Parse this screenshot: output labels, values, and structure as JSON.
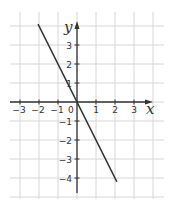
{
  "chart_data": {
    "type": "line",
    "title": "",
    "xlabel": "x",
    "ylabel": "y",
    "origin_label": "0",
    "xlim": [
      -3.5,
      4
    ],
    "ylim": [
      -5,
      4.2
    ],
    "grid": true,
    "x_ticks": [
      -3,
      -2,
      -1,
      1,
      2,
      3
    ],
    "y_ticks": [
      3,
      2,
      1,
      -1,
      -2,
      -3,
      -4
    ],
    "x_tick_labels": [
      "−3",
      "−2",
      "−1",
      "1",
      "2",
      "3"
    ],
    "y_tick_labels": [
      "3",
      "2",
      "1",
      "−1",
      "−2",
      "−3",
      "−4"
    ],
    "series": [
      {
        "name": "y = -2x",
        "x": [
          -2.05,
          2.1
        ],
        "y": [
          4.1,
          -4.2
        ],
        "color": "#333333"
      }
    ]
  },
  "colors": {
    "grid": "#d6d6d6",
    "axis": "#333333",
    "line": "#333333",
    "background": "#ffffff"
  }
}
